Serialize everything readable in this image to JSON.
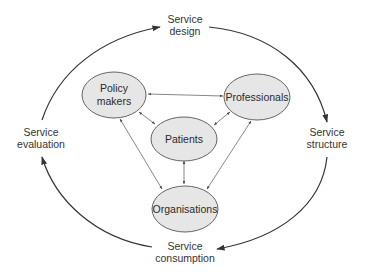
{
  "diagram": {
    "type": "cycle-with-stakeholder-network",
    "cycle_stages": [
      {
        "id": "design",
        "line1": "Service",
        "line2": "design"
      },
      {
        "id": "structure",
        "line1": "Service",
        "line2": "structure"
      },
      {
        "id": "consumption",
        "line1": "Service",
        "line2": "consumption"
      },
      {
        "id": "evaluation",
        "line1": "Service",
        "line2": "evaluation"
      }
    ],
    "cycle_flow": [
      {
        "from": "evaluation",
        "to": "design"
      },
      {
        "from": "design",
        "to": "structure"
      },
      {
        "from": "structure",
        "to": "consumption"
      },
      {
        "from": "consumption",
        "to": "evaluation"
      }
    ],
    "nodes": [
      {
        "id": "policy_makers",
        "line1": "Policy",
        "line2": "makers"
      },
      {
        "id": "professionals",
        "line1": "Professionals"
      },
      {
        "id": "patients",
        "line1": "Patients"
      },
      {
        "id": "organisations",
        "line1": "Organisations"
      }
    ],
    "links": [
      {
        "a": "policy_makers",
        "b": "professionals",
        "bidirectional": true
      },
      {
        "a": "policy_makers",
        "b": "patients",
        "bidirectional": true
      },
      {
        "a": "professionals",
        "b": "patients",
        "bidirectional": true
      },
      {
        "a": "patients",
        "b": "organisations",
        "bidirectional": true
      },
      {
        "a": "policy_makers",
        "b": "organisations",
        "bidirectional": true
      },
      {
        "a": "professionals",
        "b": "organisations",
        "bidirectional": true
      }
    ],
    "colors": {
      "node_fill": "#e6e6e6",
      "node_stroke": "#555555",
      "arc_stroke": "#333333",
      "text": "#333333"
    }
  }
}
